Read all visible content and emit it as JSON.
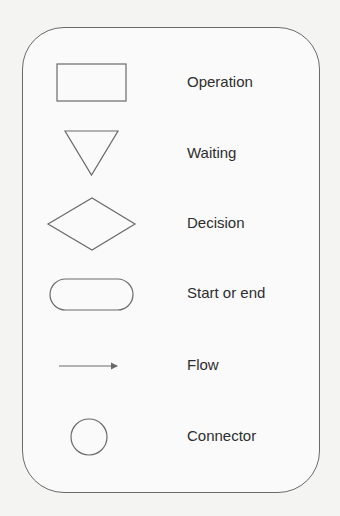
{
  "legend": {
    "title": "Flowchart symbols legend",
    "items": [
      {
        "symbol": "rectangle",
        "label": "Operation"
      },
      {
        "symbol": "inverted-triangle",
        "label": "Waiting"
      },
      {
        "symbol": "diamond",
        "label": "Decision"
      },
      {
        "symbol": "rounded-pill",
        "label": "Start or end"
      },
      {
        "symbol": "arrow",
        "label": "Flow"
      },
      {
        "symbol": "circle",
        "label": "Connector"
      }
    ]
  },
  "colors": {
    "stroke": "#6a6a6a",
    "text": "#2e2e2e",
    "background": "#f4f4f2"
  }
}
